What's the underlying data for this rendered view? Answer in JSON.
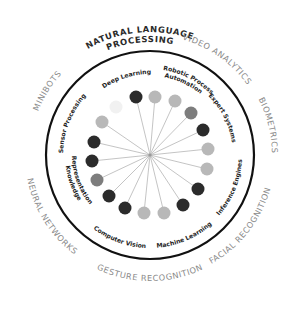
{
  "center": {
    "x": 150,
    "y": 155
  },
  "ring": {
    "radius": 104,
    "stroke": "#111111",
    "width": 2.2
  },
  "spokes": {
    "radius": 58,
    "color": "#b5b5b5",
    "dot_radius": 6.5
  },
  "colors": {
    "dark": "#2b2b2b",
    "mid": "#7d7d7d",
    "light": "#b8b8b8",
    "faint": "#f1f1f1",
    "outer_text": "#8a8a8a",
    "outer_text_strong": "#2a2a2a"
  },
  "dots": [
    {
      "x": 136,
      "y": 97,
      "tone": "dark"
    },
    {
      "x": 155,
      "y": 97,
      "tone": "light"
    },
    {
      "x": 175,
      "y": 101,
      "tone": "light"
    },
    {
      "x": 191,
      "y": 113,
      "tone": "mid"
    },
    {
      "x": 203,
      "y": 130,
      "tone": "dark"
    },
    {
      "x": 208,
      "y": 149,
      "tone": "light"
    },
    {
      "x": 207,
      "y": 169,
      "tone": "light"
    },
    {
      "x": 198,
      "y": 189,
      "tone": "dark"
    },
    {
      "x": 183,
      "y": 205,
      "tone": "dark"
    },
    {
      "x": 164,
      "y": 213,
      "tone": "light"
    },
    {
      "x": 144,
      "y": 213,
      "tone": "light"
    },
    {
      "x": 125,
      "y": 208,
      "tone": "dark"
    },
    {
      "x": 109,
      "y": 196,
      "tone": "dark"
    },
    {
      "x": 97,
      "y": 180,
      "tone": "mid"
    },
    {
      "x": 92,
      "y": 161,
      "tone": "dark"
    },
    {
      "x": 94,
      "y": 142,
      "tone": "dark"
    },
    {
      "x": 102,
      "y": 122,
      "tone": "light"
    },
    {
      "x": 116,
      "y": 107,
      "tone": "faint"
    }
  ],
  "inner_labels": [
    {
      "text": "Deep Learning",
      "angle": -107,
      "r": 81
    },
    {
      "text": "Robotic Process",
      "angle": -63,
      "r": 86
    },
    {
      "text": "Automation",
      "angle": -65,
      "r": 79
    },
    {
      "text": "Expert Systems",
      "angle": -27,
      "r": 83
    },
    {
      "text": "Inference Engines",
      "angle": 22,
      "r": 87
    },
    {
      "text": "Machine Learning",
      "angle": 67,
      "r": 88
    },
    {
      "text": "Computer Vision",
      "angle": 110,
      "r": 88
    },
    {
      "text": "Knowledge",
      "angle": 160,
      "r": 80
    },
    {
      "text": "Representation",
      "angle": 160,
      "r": 73
    },
    {
      "text": "Sensor Processing",
      "angle": -158,
      "r": 87
    }
  ],
  "outer_labels": [
    {
      "text": "NATURAL LANGUAGE",
      "angle": -95,
      "r": 123,
      "strong": true
    },
    {
      "text": "PROCESSING",
      "angle": -95,
      "r": 113,
      "strong": true
    },
    {
      "text": "VIDEO ANALYTICS",
      "angle": -55,
      "r": 120,
      "strong": false
    },
    {
      "text": "BIOMETRICS",
      "angle": -14,
      "r": 122,
      "strong": false
    },
    {
      "text": "FACIAL RECOGNITION",
      "angle": 38,
      "r": 120,
      "strong": false
    },
    {
      "text": "GESTURE RECOGNITION",
      "angle": 90,
      "r": 121,
      "strong": false
    },
    {
      "text": "NEURAL NETWORKS",
      "angle": 148,
      "r": 120,
      "strong": false
    },
    {
      "text": "MINIBOTS",
      "angle": -148,
      "r": 120,
      "strong": false
    }
  ]
}
